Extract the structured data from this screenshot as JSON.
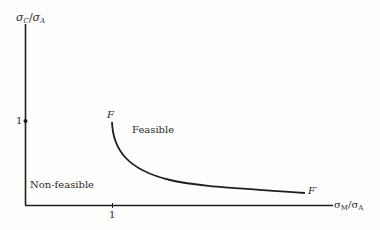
{
  "diagram": {
    "y_axis_label": {
      "num": "σ",
      "num_sub": "C",
      "slash": "/",
      "den": "σ",
      "den_sub": "A"
    },
    "x_axis_label": {
      "num": "σ",
      "num_sub": "M",
      "slash": "/",
      "den": "σ",
      "den_sub": "A"
    },
    "y_tick_label": "1",
    "x_tick_label": "1",
    "curve_start_label": "F",
    "curve_end_label": "F′",
    "region_feasible": "Feasible",
    "region_non_feasible": "Non-feasible",
    "colors": {
      "line": "#1e1e1e",
      "text": "#2a2a2a",
      "background": "#fdfdfc"
    }
  }
}
